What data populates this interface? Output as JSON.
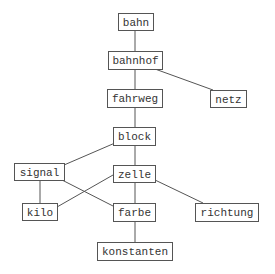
{
  "diagram": {
    "type": "dependency-graph",
    "nodes": [
      {
        "id": "bahn",
        "label": "bahn"
      },
      {
        "id": "bahnhof",
        "label": "bahnhof"
      },
      {
        "id": "fahrweg",
        "label": "fahrweg"
      },
      {
        "id": "netz",
        "label": "netz"
      },
      {
        "id": "block",
        "label": "block"
      },
      {
        "id": "signal",
        "label": "signal"
      },
      {
        "id": "zelle",
        "label": "zelle"
      },
      {
        "id": "kilo",
        "label": "kilo"
      },
      {
        "id": "farbe",
        "label": "farbe"
      },
      {
        "id": "richtung",
        "label": "richtung"
      },
      {
        "id": "konstanten",
        "label": "konstanten"
      }
    ],
    "edges": [
      {
        "from": "bahn",
        "to": "bahnhof"
      },
      {
        "from": "bahnhof",
        "to": "fahrweg"
      },
      {
        "from": "bahnhof",
        "to": "netz"
      },
      {
        "from": "fahrweg",
        "to": "block"
      },
      {
        "from": "block",
        "to": "signal"
      },
      {
        "from": "block",
        "to": "zelle"
      },
      {
        "from": "signal",
        "to": "kilo"
      },
      {
        "from": "signal",
        "to": "farbe"
      },
      {
        "from": "zelle",
        "to": "kilo"
      },
      {
        "from": "zelle",
        "to": "farbe"
      },
      {
        "from": "zelle",
        "to": "richtung"
      },
      {
        "from": "farbe",
        "to": "konstanten"
      }
    ]
  }
}
